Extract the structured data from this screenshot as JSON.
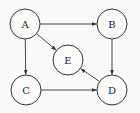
{
  "diagram": {
    "type": "directed-graph",
    "nodes": [
      {
        "id": "A",
        "label": "A",
        "x": 25,
        "y": 24
      },
      {
        "id": "B",
        "label": "B",
        "x": 112,
        "y": 24
      },
      {
        "id": "E",
        "label": "E",
        "x": 68,
        "y": 60
      },
      {
        "id": "C",
        "label": "C",
        "x": 26,
        "y": 90
      },
      {
        "id": "D",
        "label": "D",
        "x": 112,
        "y": 90
      }
    ],
    "edges": [
      {
        "from": "A",
        "to": "B"
      },
      {
        "from": "A",
        "to": "C"
      },
      {
        "from": "A",
        "to": "E"
      },
      {
        "from": "B",
        "to": "D"
      },
      {
        "from": "C",
        "to": "D"
      },
      {
        "from": "D",
        "to": "E"
      }
    ],
    "node_radius": 15
  }
}
